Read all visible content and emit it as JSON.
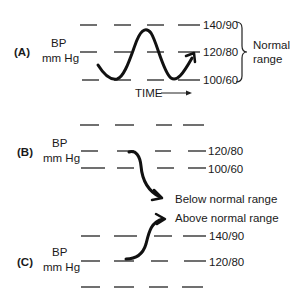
{
  "panels": {
    "a": {
      "label": "(A)",
      "ylabel_line1": "BP",
      "ylabel_line2": "mm Hg",
      "levels": [
        "140/90",
        "120/80",
        "100/60"
      ],
      "range_label_line1": "Normal",
      "range_label_line2": "range",
      "xlabel": "TIME"
    },
    "b": {
      "label": "(B)",
      "ylabel_line1": "BP",
      "ylabel_line2": "mm Hg",
      "levels": [
        "120/80",
        "100/60"
      ],
      "annotation": "Below normal range"
    },
    "c": {
      "label": "(C)",
      "ylabel_line1": "BP",
      "ylabel_line2": "mm Hg",
      "levels": [
        "140/90",
        "120/80"
      ],
      "annotation": "Above normal range"
    }
  }
}
